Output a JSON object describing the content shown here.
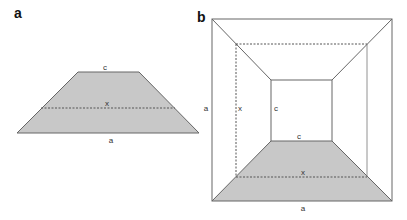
{
  "panels": {
    "a": {
      "label": "a",
      "labels": {
        "top": "c",
        "middle": "x",
        "bottom": "a"
      }
    },
    "b": {
      "label": "b",
      "labels": {
        "side_outer": "a",
        "side_dashed": "x",
        "side_inner": "c",
        "bottom_inner": "c",
        "bottom_dashed": "x",
        "bottom_outer": "a"
      }
    }
  },
  "colors": {
    "fill": "#c8c8c8",
    "stroke": "#666666",
    "dashed": "#555555"
  }
}
